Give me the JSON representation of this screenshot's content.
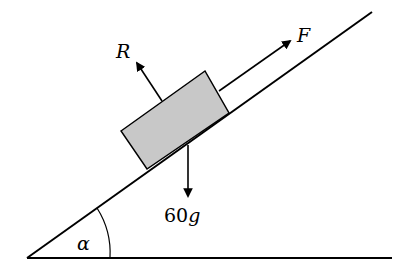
{
  "diagram": {
    "labels": {
      "normal_reaction": "R",
      "applied_force": "F",
      "weight_number": "60",
      "weight_symbol": "g",
      "angle": "α"
    },
    "colors": {
      "block_fill": "#c8c8c8",
      "line": "#000000",
      "background": "#ffffff"
    },
    "elements": [
      {
        "id": "incline",
        "type": "line",
        "from": [
          27,
          258
        ],
        "to": [
          372,
          12
        ]
      },
      {
        "id": "ground",
        "type": "line",
        "from": [
          27,
          258
        ],
        "to": [
          392,
          258
        ]
      },
      {
        "id": "block",
        "type": "rectangle",
        "corners": [
          [
            121,
            131
          ],
          [
            205,
            71
          ],
          [
            229,
            113
          ],
          [
            147,
            169
          ]
        ]
      },
      {
        "id": "force-R",
        "type": "arrow",
        "direction": "perpendicular to incline, away from surface"
      },
      {
        "id": "force-F",
        "type": "arrow",
        "direction": "up the slope, parallel to incline"
      },
      {
        "id": "force-weight",
        "type": "arrow",
        "direction": "vertically down"
      },
      {
        "id": "angle-arc",
        "type": "arc",
        "at": "base vertex"
      }
    ]
  }
}
